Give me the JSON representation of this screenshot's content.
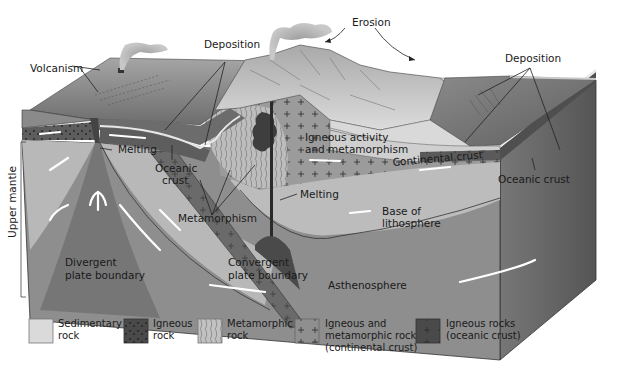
{
  "diagram": {
    "labels": {
      "volcanism": "Volcanism",
      "deposition_left": "Deposition",
      "erosion": "Erosion",
      "deposition_right": "Deposition",
      "melting_ridge": "Melting",
      "oceanic_crust_left_1": "Oceanic",
      "oceanic_crust_left_2": "crust",
      "igneous_activity_1": "Igneous activity",
      "igneous_activity_2": "and metamorphism",
      "continental_crust": "Continental crust",
      "oceanic_crust_right": "Oceanic crust",
      "melting_subduction": "Melting",
      "metamorphism": "Metamorphism",
      "base_lithosphere_1": "Base of",
      "base_lithosphere_2": "lithosphere",
      "divergent_1": "Divergent",
      "divergent_2": "plate boundary",
      "convergent_1": "Convergent",
      "convergent_2": "plate boundary",
      "asthenosphere": "Asthenosphere",
      "upper_mantle": "Upper mantle"
    },
    "colors": {
      "sky": "#ffffff",
      "ocean_surface": "#7d7d7d",
      "ocean_top_dark": "#6a6a6a",
      "lithosphere_mantle": "#b9b9b9",
      "asthenosphere": "#8e8e8e",
      "oceanic_crust": "#5a5a5a",
      "continental_crust": "#9a9a9a",
      "sedimentary": "#d8d8d8",
      "mountain": "#cfcfcf",
      "side_face": "#6f6f6f",
      "magma": "#3c3c3c",
      "flow_arrow": "#ffffff"
    }
  },
  "legend": {
    "items": [
      {
        "line1": "Sedimentary",
        "line2": "rock",
        "line3": "",
        "swatch": "sedimentary"
      },
      {
        "line1": "Igneous",
        "line2": "rock",
        "line3": "",
        "swatch": "igneous"
      },
      {
        "line1": "Metamorphic",
        "line2": "rock",
        "line3": "",
        "swatch": "metamorphic"
      },
      {
        "line1": "Igneous and",
        "line2": "metamorphic rock",
        "line3": "(continental crust)",
        "swatch": "continental"
      },
      {
        "line1": "Igneous rocks",
        "line2": "(oceanic crust)",
        "line3": "",
        "swatch": "oceanic"
      }
    ]
  }
}
